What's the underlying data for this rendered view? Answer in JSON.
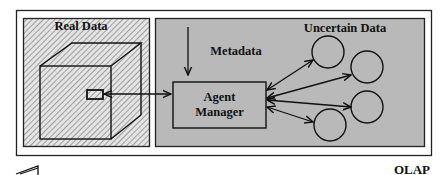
{
  "diagram": {
    "panels": {
      "real_data": {
        "label": "Real Data",
        "pattern": "diagonal-hatch"
      },
      "uncertain_data": {
        "label": "Uncertain Data",
        "fill": "#b9b9b9"
      }
    },
    "nodes": {
      "metadata": {
        "label": "Metadata"
      },
      "agent_manager": {
        "label_line1": "Agent",
        "label_line2": "Manager"
      },
      "cube": {
        "label": "data-cube"
      },
      "uncertain_nodes": [
        {
          "id": "node-1"
        },
        {
          "id": "node-2"
        },
        {
          "id": "node-3"
        },
        {
          "id": "node-4"
        }
      ]
    },
    "caption": "OLAP",
    "colors": {
      "stroke": "#111111",
      "frame_bg": "#ffffff",
      "gray_panel": "#b9b9b9",
      "hatch_light": "#e6e6e6",
      "hatch_dark": "#8a8a8a"
    }
  }
}
